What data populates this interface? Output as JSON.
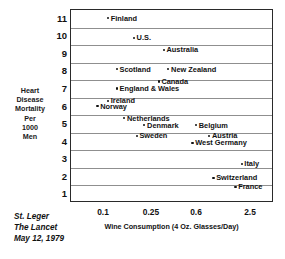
{
  "chart_data": {
    "type": "scatter",
    "title": "",
    "xlabel": "Wine Consumption (4 Oz. Glasses/Day)",
    "ylabel": "Heart Disease Mortality Per 1000 Men",
    "ylabel_lines": [
      "Heart",
      "Disease",
      "Mortality",
      "Per",
      "1000",
      "Men"
    ],
    "xscale": "log",
    "xticks": [
      0.1,
      0.25,
      0.6,
      2.5
    ],
    "xtick_labels": [
      "0.1",
      "0.25",
      "0.6",
      "2.5"
    ],
    "yticks": [
      1,
      2,
      3,
      4,
      5,
      6,
      7,
      8,
      9,
      10,
      11
    ],
    "ytick_labels": [
      "1",
      "2",
      "3",
      "4",
      "5",
      "6",
      "7",
      "8",
      "9",
      "10",
      "11"
    ],
    "ylim": [
      0.5,
      11.5
    ],
    "grid": "horizontal",
    "legend": "none",
    "points": [
      {
        "label": "Finland",
        "x": 0.11,
        "y": 11.0
      },
      {
        "label": "U.S.",
        "x": 0.18,
        "y": 9.9
      },
      {
        "label": "Australia",
        "x": 0.32,
        "y": 9.2
      },
      {
        "label": "Scotland",
        "x": 0.13,
        "y": 8.1
      },
      {
        "label": "New Zealand",
        "x": 0.35,
        "y": 8.1
      },
      {
        "label": "Canada",
        "x": 0.29,
        "y": 7.4
      },
      {
        "label": "England & Wales",
        "x": 0.13,
        "y": 7.0
      },
      {
        "label": "Ireland",
        "x": 0.11,
        "y": 6.3
      },
      {
        "label": "Norway",
        "x": 0.09,
        "y": 6.0
      },
      {
        "label": "Netherlands",
        "x": 0.15,
        "y": 5.3
      },
      {
        "label": "Denmark",
        "x": 0.22,
        "y": 4.9
      },
      {
        "label": "Belgium",
        "x": 0.6,
        "y": 4.9
      },
      {
        "label": "Sweden",
        "x": 0.19,
        "y": 4.3
      },
      {
        "label": "Austria",
        "x": 0.85,
        "y": 4.3
      },
      {
        "label": "West Germany",
        "x": 0.56,
        "y": 3.9
      },
      {
        "label": "Italy",
        "x": 2.0,
        "y": 2.7
      },
      {
        "label": "Switzerland",
        "x": 0.95,
        "y": 1.9
      },
      {
        "label": "France",
        "x": 1.7,
        "y": 1.4
      }
    ]
  },
  "source": {
    "lines": [
      "St. Leger",
      "The Lancet",
      "May 12, 1979"
    ]
  }
}
